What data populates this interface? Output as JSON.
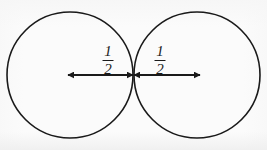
{
  "figure": {
    "width": 267,
    "height": 150,
    "background_color": "#fbfbfb",
    "ink_color": "#1a1a1a"
  },
  "geometry": {
    "circles": [
      {
        "name": "left-circle",
        "center_x": 70,
        "center_y": 75,
        "radius": 63,
        "stroke_width": 1.6,
        "fill": "none"
      },
      {
        "name": "right-circle",
        "center_x": 197,
        "center_y": 75,
        "radius": 63,
        "stroke_width": 1.6,
        "fill": "none"
      }
    ],
    "tangent_point": {
      "x": 133,
      "y": 75
    },
    "arrows": [
      {
        "name": "left-radius-arrow",
        "x1": 68,
        "x2": 133,
        "y": 75,
        "double_headed": true,
        "stroke_width": 1.8
      },
      {
        "name": "right-radius-arrow",
        "x1": 134,
        "x2": 200,
        "y": 75,
        "double_headed": true,
        "stroke_width": 1.8
      }
    ]
  },
  "labels": [
    {
      "name": "left-radius-label",
      "numerator": "1",
      "denominator": "2",
      "text": "1/2",
      "x": 108,
      "y": 44
    },
    {
      "name": "right-radius-label",
      "numerator": "1",
      "denominator": "2",
      "text": "1/2",
      "x": 160,
      "y": 44
    }
  ]
}
